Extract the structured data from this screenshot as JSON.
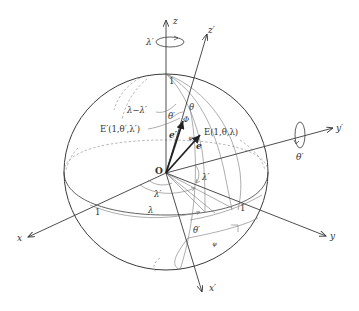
{
  "diagram": {
    "colors": {
      "stroke": "#3a3a3a",
      "thin": "#777777",
      "text": "#333333",
      "background": "#ffffff"
    },
    "axes": {
      "z": "z",
      "z_prime": "z′",
      "x": "x",
      "x_prime": "x′",
      "y": "y",
      "y_prime": "y′"
    },
    "origin_label": "O",
    "rotations": {
      "about_z": "λ′",
      "about_y_prime": "θ′"
    },
    "points": {
      "E": "E(1,θ,λ)",
      "E_prime": "E′(1,θ′,λ′)"
    },
    "vectors": {
      "e": "e",
      "e_prime": "e′"
    },
    "angles": {
      "lambda_minus_lambda_prime": "λ−λ′",
      "theta": "θ",
      "theta_prime_top": "θ′",
      "Phi": "Φ",
      "psi_top": "ψ",
      "lambda_prime_right": "λ′",
      "lambda_prime_equator": "λ′",
      "lambda_equator": "λ",
      "theta_prime_bottom": "θ′",
      "psi_bottom": "ψ"
    },
    "unit_marks": {
      "z_top": "1",
      "x": "1",
      "y": "1"
    }
  }
}
